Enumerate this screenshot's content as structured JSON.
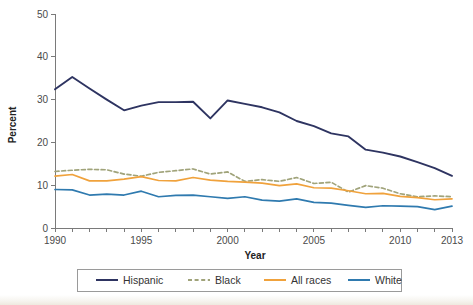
{
  "chart_data": {
    "type": "line",
    "title": "",
    "xlabel": "Year",
    "ylabel": "Percent",
    "x": [
      1990,
      1991,
      1992,
      1993,
      1994,
      1995,
      1996,
      1997,
      1998,
      1999,
      2000,
      2001,
      2002,
      2003,
      2004,
      2005,
      2006,
      2007,
      2008,
      2009,
      2010,
      2011,
      2012,
      2013
    ],
    "xlim": [
      1990,
      2013
    ],
    "ylim": [
      0,
      50
    ],
    "y_ticks": [
      0,
      10,
      20,
      30,
      40,
      50
    ],
    "x_ticks_labeled": [
      "1990",
      "1995",
      "2000",
      "2005",
      "2010",
      "2013"
    ],
    "x_tick_values_labeled": [
      1990,
      1995,
      2000,
      2005,
      2010,
      2013
    ],
    "grid": false,
    "legend_position": "bottom",
    "series": [
      {
        "name": "Hispanic",
        "color": "#2e3461",
        "style": "solid",
        "values": [
          32.4,
          35.3,
          32.6,
          30.0,
          27.5,
          28.6,
          29.4,
          29.4,
          29.5,
          25.6,
          29.8,
          29.0,
          28.2,
          27.0,
          25.0,
          23.8,
          22.1,
          21.4,
          18.3,
          17.6,
          16.7,
          15.4,
          14.0,
          12.2
        ]
      },
      {
        "name": "Black",
        "color": "#a0a37a",
        "style": "dashed",
        "values": [
          13.2,
          13.5,
          13.7,
          13.6,
          12.6,
          12.1,
          13.0,
          13.4,
          13.8,
          12.6,
          13.1,
          10.9,
          11.3,
          10.9,
          11.8,
          10.4,
          10.7,
          8.4,
          9.9,
          9.3,
          8.0,
          7.3,
          7.5,
          7.3
        ]
      },
      {
        "name": "All races",
        "color": "#f0a23c",
        "style": "solid",
        "values": [
          12.1,
          12.5,
          11.0,
          11.0,
          11.4,
          12.0,
          11.1,
          11.0,
          11.8,
          11.2,
          10.9,
          10.7,
          10.5,
          9.9,
          10.3,
          9.4,
          9.3,
          8.7,
          8.0,
          8.1,
          7.4,
          7.1,
          6.6,
          6.8
        ]
      },
      {
        "name": "White",
        "color": "#2f7aaf",
        "style": "solid",
        "values": [
          9.0,
          8.9,
          7.7,
          7.9,
          7.7,
          8.6,
          7.3,
          7.6,
          7.7,
          7.3,
          6.9,
          7.3,
          6.5,
          6.3,
          6.8,
          6.0,
          5.8,
          5.3,
          4.8,
          5.2,
          5.1,
          5.0,
          4.3,
          5.1
        ]
      }
    ]
  },
  "legend": {
    "entries": [
      {
        "label": "Hispanic"
      },
      {
        "label": "Black"
      },
      {
        "label": "All races"
      },
      {
        "label": "White"
      }
    ]
  }
}
